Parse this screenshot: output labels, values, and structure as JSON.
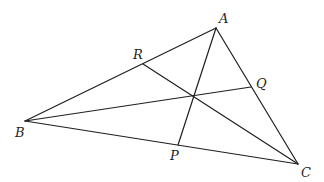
{
  "diagram": {
    "type": "triangle-with-concurrent-cevians",
    "points": {
      "A": {
        "x": 216,
        "y": 28,
        "label": "A",
        "lx": 219,
        "ly": 23
      },
      "B": {
        "x": 25,
        "y": 121,
        "label": "B",
        "lx": 15,
        "ly": 137
      },
      "C": {
        "x": 298,
        "y": 164,
        "label": "C",
        "lx": 301,
        "ly": 177
      },
      "P": {
        "x": 178,
        "y": 145,
        "label": "P",
        "lx": 170,
        "ly": 160
      },
      "Q": {
        "x": 251,
        "y": 87,
        "label": "Q",
        "lx": 256,
        "ly": 88
      },
      "R": {
        "x": 143,
        "y": 64,
        "label": "R",
        "lx": 133,
        "ly": 59
      }
    },
    "concurrency_point": {
      "x": 194,
      "y": 96
    },
    "segments": [
      {
        "from": "A",
        "to": "B",
        "name": "side-ab"
      },
      {
        "from": "B",
        "to": "C",
        "name": "side-bc"
      },
      {
        "from": "C",
        "to": "A",
        "name": "side-ca"
      },
      {
        "from": "A",
        "to": "P",
        "name": "cevian-ap"
      },
      {
        "from": "B",
        "to": "Q",
        "name": "cevian-bq"
      },
      {
        "from": "C",
        "to": "R",
        "name": "cevian-cr"
      }
    ],
    "labels": [
      "A",
      "B",
      "C",
      "P",
      "Q",
      "R"
    ]
  }
}
